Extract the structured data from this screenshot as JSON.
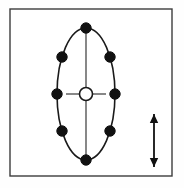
{
  "figure": {
    "background_color": "#fefefe",
    "frame": {
      "label": "diagram-border",
      "x": 10,
      "y": 9,
      "width": 162,
      "height": 167,
      "stroke_color": "#3c3c3c",
      "stroke_width": 1.4,
      "fill": "#ffffff"
    },
    "ellipse": {
      "label": "vibration-ellipse-orbit",
      "center_x": 86,
      "center_y": 94,
      "radius_x": 29,
      "radius_y": 66,
      "stroke_color": "#1a1a1a",
      "stroke_width": 1.6,
      "fill": "none"
    },
    "center_node": {
      "label": "center-open-circle",
      "center_x": 86,
      "center_y": 94,
      "radius": 6.5,
      "stroke_color": "#1a1a1a",
      "stroke_width": 1.6,
      "fill": "#ffffff"
    },
    "spokes": [
      {
        "name": "spoke-up",
        "x1": 86,
        "y1": 87.5,
        "x2": 86,
        "y2": 31
      },
      {
        "name": "spoke-down",
        "x1": 86,
        "y1": 100.5,
        "x2": 86,
        "y2": 157
      },
      {
        "name": "spoke-left",
        "x1": 79.5,
        "y1": 94,
        "x2": 66,
        "y2": 94
      },
      {
        "name": "spoke-right",
        "x1": 92.5,
        "y1": 94,
        "x2": 106,
        "y2": 94
      }
    ],
    "spoke_style": {
      "stroke_color": "#555555",
      "stroke_width": 1.4
    },
    "node_style": {
      "fill": "#111111",
      "stroke_color": "#111111",
      "stroke_width": 1,
      "radius": 5.2
    },
    "nodes": [
      {
        "name": "node-top",
        "cx": 86,
        "cy": 28
      },
      {
        "name": "node-upper-left",
        "cx": 62,
        "cy": 57
      },
      {
        "name": "node-upper-right",
        "cx": 110,
        "cy": 57
      },
      {
        "name": "node-mid-left",
        "cx": 57,
        "cy": 94
      },
      {
        "name": "node-mid-right",
        "cx": 115,
        "cy": 94
      },
      {
        "name": "node-lower-left",
        "cx": 62,
        "cy": 131
      },
      {
        "name": "node-lower-right",
        "cx": 110,
        "cy": 131
      },
      {
        "name": "node-bottom",
        "cx": 86,
        "cy": 160
      }
    ],
    "arrow": {
      "label": "vertical-double-arrow",
      "x": 154,
      "y_top": 114,
      "y_bottom": 167,
      "shaft_width": 1.8,
      "head_half_width": 4.2,
      "head_length": 9,
      "color": "#111111"
    }
  }
}
